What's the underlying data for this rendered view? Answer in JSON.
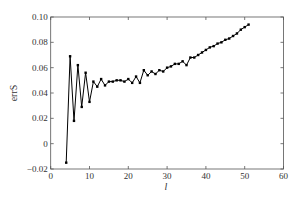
{
  "chart_data": {
    "type": "line",
    "title": "",
    "xlabel": "l",
    "ylabel": "errS",
    "xlim": [
      0,
      60
    ],
    "ylim": [
      -0.02,
      0.1
    ],
    "xticks": [
      0,
      10,
      20,
      30,
      40,
      50,
      60
    ],
    "xtick_labels": [
      "0",
      "10",
      "20",
      "30",
      "40",
      "50",
      "60"
    ],
    "yticks": [
      -0.02,
      0,
      0.02,
      0.04,
      0.06,
      0.08,
      0.1
    ],
    "ytick_labels": [
      "−0.02",
      "0",
      "0.02",
      "0.04",
      "0.06",
      "0.08",
      "0.10"
    ],
    "grid": false,
    "legend": null,
    "series": [
      {
        "name": "errS",
        "color": "#000000",
        "marker": "square",
        "x": [
          4,
          5,
          6,
          7,
          8,
          9,
          10,
          11,
          12,
          13,
          14,
          15,
          16,
          17,
          18,
          19,
          20,
          21,
          22,
          23,
          24,
          25,
          26,
          27,
          28,
          29,
          30,
          31,
          32,
          33,
          34,
          35,
          36,
          37,
          38,
          39,
          40,
          41,
          42,
          43,
          44,
          45,
          46,
          47,
          48,
          49,
          50,
          51
        ],
        "values": [
          -0.015,
          0.069,
          0.018,
          0.062,
          0.029,
          0.056,
          0.033,
          0.049,
          0.045,
          0.051,
          0.046,
          0.049,
          0.049,
          0.05,
          0.05,
          0.049,
          0.051,
          0.048,
          0.053,
          0.048,
          0.058,
          0.054,
          0.057,
          0.055,
          0.058,
          0.057,
          0.06,
          0.061,
          0.063,
          0.063,
          0.065,
          0.062,
          0.068,
          0.068,
          0.07,
          0.072,
          0.074,
          0.076,
          0.077,
          0.079,
          0.08,
          0.082,
          0.083,
          0.085,
          0.087,
          0.09,
          0.092,
          0.094
        ]
      }
    ]
  }
}
